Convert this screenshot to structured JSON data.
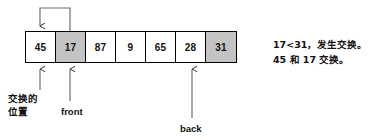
{
  "diagram": {
    "array": {
      "cells": [
        {
          "value": "45",
          "shaded": false
        },
        {
          "value": "17",
          "shaded": true
        },
        {
          "value": "87",
          "shaded": false
        },
        {
          "value": "9",
          "shaded": false
        },
        {
          "value": "65",
          "shaded": false
        },
        {
          "value": "28",
          "shaded": false
        },
        {
          "value": "31",
          "shaded": true
        }
      ]
    },
    "labels": {
      "swap_position": "交换的\n位置",
      "swap_position_line1": "交换的",
      "swap_position_line2": "位置",
      "front": "front",
      "back": "back"
    },
    "note": {
      "line1": "17<31，发生交换。",
      "line2": "45 和 17 交换。"
    },
    "colors": {
      "shaded_cell": "#c3c3c3",
      "cell": "#ffffff",
      "stroke": "#000000",
      "text": "#111111",
      "background": "#ffffff"
    },
    "annotations": {
      "swap_arc_from_cell": "17",
      "swap_arc_to_cell": "45",
      "front_points_to_cell": "17",
      "back_points_to_cell": "28",
      "swap_position_points_to_cell": "45"
    }
  }
}
